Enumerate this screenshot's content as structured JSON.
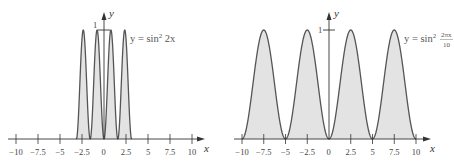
{
  "chart_data": [
    {
      "type": "area",
      "title": "",
      "equation": {
        "prefix": "y = sin",
        "exp": "2",
        "arg": " 2x"
      },
      "function": "sin^2(2x)",
      "domain": [
        -3.14159,
        3.14159
      ],
      "xlabel": "x",
      "ylabel": "y",
      "xlim": [
        -10,
        10
      ],
      "ylim": [
        0,
        1
      ],
      "xticks": [
        -10,
        -7.5,
        -5,
        -2.5,
        0,
        2.5,
        5,
        7.5,
        10
      ],
      "xtick_labels": [
        "−10",
        "−7.5",
        "−5",
        "−2.5",
        "0",
        "2.5",
        "5",
        "7.5",
        "10"
      ],
      "yticks": [
        1
      ],
      "ytick_labels": [
        "1"
      ],
      "grid": false,
      "fill_color": "#e3e3e3",
      "line_color": "#555555"
    },
    {
      "type": "area",
      "title": "",
      "equation": {
        "prefix": "y = sin",
        "exp": "2",
        "num": "2πx",
        "den": "10"
      },
      "function": "sin^2(2*pi*x/10)",
      "domain": [
        -10,
        10
      ],
      "xlabel": "x",
      "ylabel": "y",
      "xlim": [
        -10,
        10
      ],
      "ylim": [
        0,
        1
      ],
      "xticks": [
        -10,
        -7.5,
        -5,
        -2.5,
        0,
        2.5,
        5,
        7.5,
        10
      ],
      "xtick_labels": [
        "−10",
        "−7.5",
        "−5",
        "−2.5",
        "0",
        "2.5",
        "5",
        "7.5",
        "10"
      ],
      "yticks": [
        1
      ],
      "ytick_labels": [
        "1"
      ],
      "grid": false,
      "fill_color": "#e3e3e3",
      "line_color": "#555555"
    }
  ]
}
